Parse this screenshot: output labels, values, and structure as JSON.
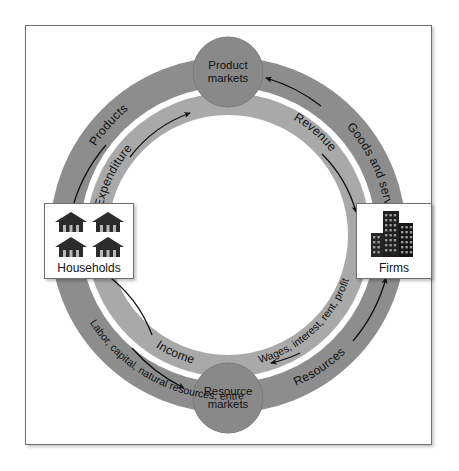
{
  "diagram": {
    "type": "circular-flow",
    "colors": {
      "outer_ring": "#8d8d8d",
      "inner_ring": "#a9a9a9",
      "hub_circle": "#898989",
      "page_background": "#ffffff",
      "panel_background": "#ffffff",
      "border": "#6f6f6f",
      "text": "#111111"
    },
    "hubs": [
      {
        "id": "product-markets",
        "line1": "Product",
        "line2": "markets",
        "position": "top"
      },
      {
        "id": "resource-markets",
        "line1": "Resource",
        "line2": "markets",
        "position": "bottom"
      }
    ],
    "nodes": [
      {
        "id": "households",
        "label": "Households",
        "icon": "houses-icon",
        "position": "left",
        "icon_count": 4
      },
      {
        "id": "firms",
        "label": "Firms",
        "icon": "buildings-icon",
        "position": "right",
        "icon_count": 1
      }
    ],
    "flows": [
      {
        "id": "products",
        "label": "Products",
        "ring": "outer",
        "quadrant": "top-left",
        "from": "product-markets",
        "to": "households",
        "direction": "counter-clockwise"
      },
      {
        "id": "expenditure",
        "label": "Expenditure",
        "ring": "inner",
        "quadrant": "top-left",
        "from": "households",
        "to": "product-markets",
        "direction": "clockwise"
      },
      {
        "id": "goods-and-services",
        "label": "Goods and services",
        "ring": "outer",
        "quadrant": "top-right",
        "from": "firms",
        "to": "product-markets",
        "direction": "counter-clockwise"
      },
      {
        "id": "revenue",
        "label": "Revenue",
        "ring": "inner",
        "quadrant": "top-right",
        "from": "product-markets",
        "to": "firms",
        "direction": "clockwise"
      },
      {
        "id": "factors-of-production",
        "label": "Labor, capital, natural resources, entrepreneurial ability",
        "ring": "outer",
        "quadrant": "bottom-left",
        "from": "households",
        "to": "resource-markets",
        "direction": "counter-clockwise"
      },
      {
        "id": "income",
        "label": "Income",
        "ring": "inner",
        "quadrant": "bottom-left",
        "from": "resource-markets",
        "to": "households",
        "direction": "clockwise"
      },
      {
        "id": "resources",
        "label": "Resources",
        "ring": "outer",
        "quadrant": "bottom-right",
        "from": "resource-markets",
        "to": "firms",
        "direction": "counter-clockwise"
      },
      {
        "id": "wages-interest-rent-profit",
        "label": "Wages, interest, rent, profit",
        "ring": "inner",
        "quadrant": "bottom-right",
        "from": "firms",
        "to": "resource-markets",
        "direction": "clockwise"
      }
    ]
  }
}
